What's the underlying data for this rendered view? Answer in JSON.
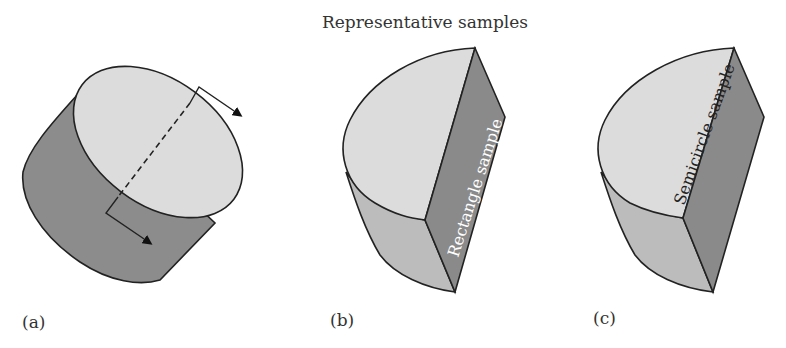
{
  "title": "Representative samples",
  "panels": [
    {
      "id": "a",
      "label": "(a)",
      "description": "Cylinder with cutting plane"
    },
    {
      "id": "b",
      "label": "(b)",
      "face_text": "Rectangle sample"
    },
    {
      "id": "c",
      "label": "(c)",
      "face_text": "Semicircle sample"
    }
  ],
  "colors": {
    "light_face": "#dcdcdc",
    "mid_face": "#b9b9b9",
    "dark_face": "#8a8a8a",
    "outline": "#222222"
  }
}
